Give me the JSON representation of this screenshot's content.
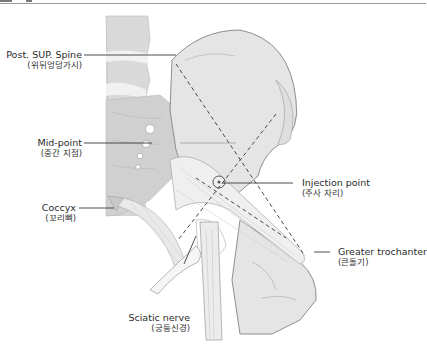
{
  "figure": {
    "labels": [
      {
        "id": "post-sup-spine",
        "en": "Post. SUP. Spine",
        "ko": "(위뒤엉덩가시)"
      },
      {
        "id": "mid-point",
        "en": "Mid-point",
        "ko": "(중간 지점)"
      },
      {
        "id": "coccyx",
        "en": "Coccyx",
        "ko": "(꼬리뼈)"
      },
      {
        "id": "injection-point",
        "en": "Injection point",
        "ko": "(주사 자리)"
      },
      {
        "id": "greater-trochanter",
        "en": "Greater trochanter",
        "ko": "(큰돌기)"
      },
      {
        "id": "sciatic-nerve",
        "en": "Sciatic nerve",
        "ko": "(궁둥신경)"
      }
    ],
    "colors": {
      "bone_fill": "#e4e4e4",
      "bone_stroke": "#8e8e8e",
      "spine_fill": "#d3d3d3",
      "muscle_fill": "#ececec",
      "leader_line": "#3a3a3a",
      "dashed_line": "#4a4a4a",
      "text": "#2b2b2b"
    }
  }
}
